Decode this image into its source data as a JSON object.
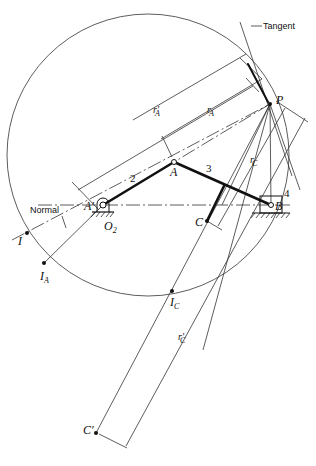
{
  "figure": {
    "type": "slider-crank curvature construction (Euler-Savary)",
    "labels": {
      "tangent": "Tangent",
      "normal": "Normal",
      "P": "P",
      "A": "A",
      "A_prime": "A′",
      "B": "B",
      "C": "C",
      "C_prime": "C′",
      "O2": "O",
      "O2_sub": "2",
      "I": "I",
      "I_A": "I",
      "I_A_sub": "A",
      "I_C": "I",
      "I_C_sub": "C",
      "rA": "r",
      "rA_sub": "A",
      "rA_prime": "r′",
      "rA_prime_sub": "A",
      "rC": "r",
      "rC_sub": "C",
      "rC_prime": "r′",
      "rC_prime_sub": "C",
      "link2": "2",
      "link3": "3",
      "link4": "4"
    },
    "points": {
      "P": [
        270,
        104
      ],
      "A": [
        174,
        162
      ],
      "O2": [
        103,
        205
      ],
      "B": [
        271,
        205
      ],
      "C": [
        207,
        221
      ],
      "C_prime": [
        96,
        433
      ],
      "I": [
        27,
        233
      ],
      "I_A": [
        44,
        263
      ],
      "I_C": [
        172,
        291
      ]
    },
    "inflection_circle": {
      "cx": 148,
      "cy": 155,
      "r": 141
    },
    "colors": {
      "ink": "#111111",
      "background": "#ffffff"
    }
  }
}
